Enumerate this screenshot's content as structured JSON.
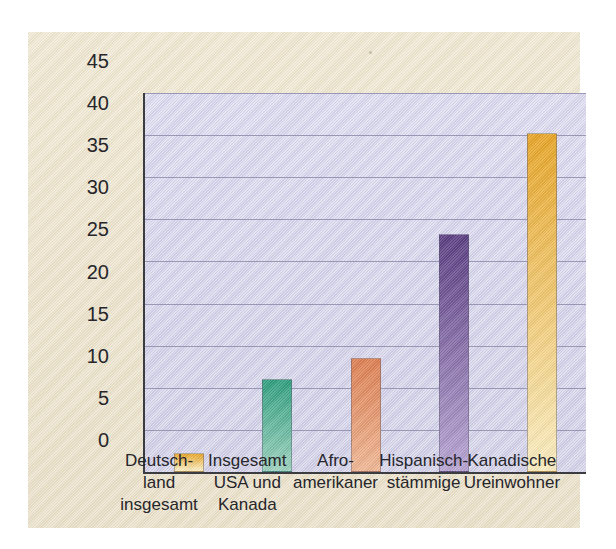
{
  "figure": {
    "panel_background": "#ece3cd",
    "plot_background": "#d6d4ea",
    "axis_color": "#3b3b42",
    "gridline_color": "#8d8cab"
  },
  "chart_data": {
    "type": "bar",
    "title": "",
    "xlabel": "",
    "ylabel": "Prozent Schulabgänger ohne\nAbschluss der High School",
    "ylabel_line1": "Prozent Schulabgänger ohne",
    "ylabel_line2": "Abschluss der High School",
    "categories": [
      "Deutsch-\nland\ninsgesamt",
      "Insgesamt\nUSA und\nKanada",
      "Afro-\namerikaner",
      "Hispanisch-\nstämmige",
      "Kanadische\nUreinwohner"
    ],
    "categories_flat": [
      "Deutschland insgesamt",
      "Insgesamt USA und Kanada",
      "Afro-amerikaner",
      "Hispanisch-stämmige",
      "Kanadische Ureinwohner"
    ],
    "values": [
      2.2,
      11.1,
      13.5,
      28.3,
      40.2
    ],
    "bar_colors": [
      "#e8a628",
      "#2f9e7e",
      "#dd7f52",
      "#5b3e82",
      "#e8a628"
    ],
    "bar_colors_bottom": [
      "#fbf0c8",
      "#9fd4c0",
      "#f0b795",
      "#b9a6d4",
      "#fbeec2"
    ],
    "ylim": [
      0,
      45
    ],
    "yticks": [
      0,
      5,
      10,
      15,
      20,
      25,
      30,
      35,
      40,
      45
    ],
    "ytick_labels": [
      "0",
      "5",
      "10",
      "15",
      "20",
      "25",
      "30",
      "35",
      "40",
      "45"
    ],
    "grid": true,
    "grid_axis": "y",
    "legend": false,
    "legend_position": "none"
  }
}
